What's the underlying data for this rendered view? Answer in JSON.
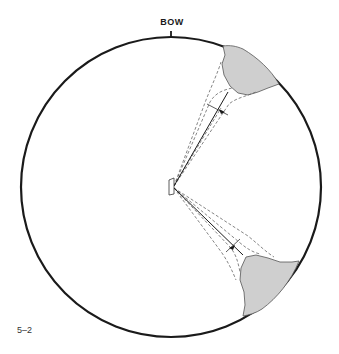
{
  "diagram": {
    "bow_label": "BOW",
    "figure_label": "5–2",
    "colors": {
      "outline": "#1a1a1a",
      "land_fill": "#cfcfcf",
      "land_stroke": "#555555",
      "dashed": "#666666",
      "background": "#ffffff"
    },
    "elements": {
      "compass_circle": "circular horizon around vessel",
      "vessel": "small ship outline at center",
      "upper_bearing_line": "solid line from vessel to upper-right landmass",
      "lower_bearing_line": "solid line from vessel to lower-right landmass",
      "upper_landmass": "shaded land at upper right",
      "lower_landmass": "shaded land at lower right"
    }
  }
}
